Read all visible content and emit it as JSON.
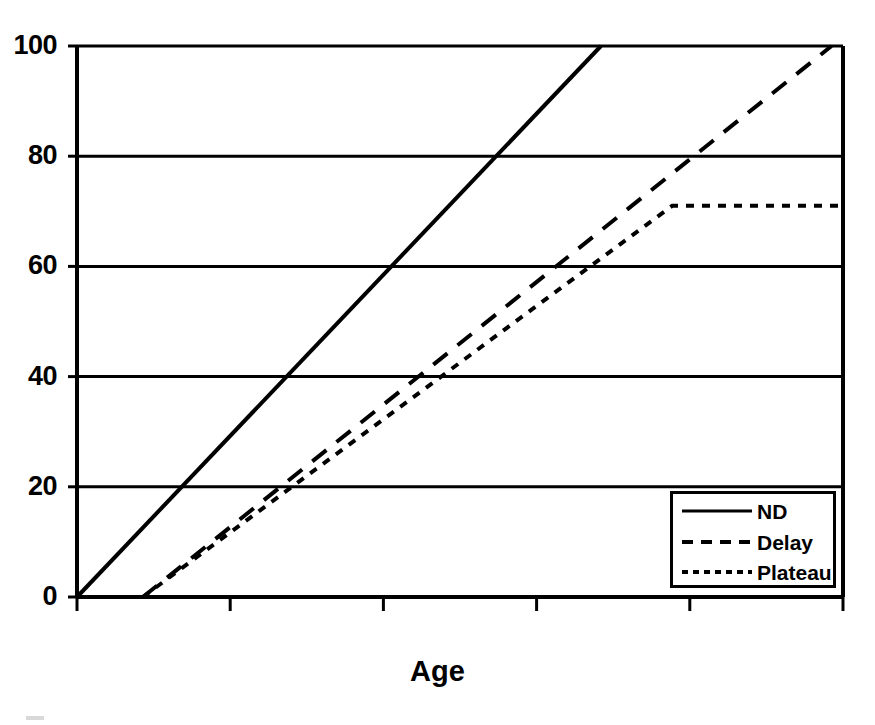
{
  "chart_data": {
    "type": "line",
    "title": "",
    "subtitle": "",
    "xlabel": "Age",
    "ylabel": "",
    "ylim": [
      0,
      100
    ],
    "xlim": [
      0,
      100
    ],
    "yticks": [
      0,
      20,
      40,
      60,
      80,
      100
    ],
    "ytick_labels": [
      "0",
      "20",
      "40",
      "60",
      "80",
      "100"
    ],
    "xticks": [
      0,
      20,
      40,
      60,
      80,
      100
    ],
    "xtick_labels": [
      "",
      "",
      "",
      "",
      "",
      ""
    ],
    "grid": "horizontal",
    "legend_position": "bottom-right",
    "series": [
      {
        "name": "ND",
        "style": "solid",
        "color": "#000000",
        "x": [
          0,
          68.4
        ],
        "y": [
          0,
          100
        ]
      },
      {
        "name": "Delay",
        "style": "dashed",
        "color": "#000000",
        "x": [
          8.6,
          98.5
        ],
        "y": [
          0,
          100
        ]
      },
      {
        "name": "Plateau",
        "style": "dotted",
        "color": "#000000",
        "x": [
          8.6,
          77.7,
          100
        ],
        "y": [
          0,
          71,
          71
        ]
      }
    ]
  },
  "axes": {
    "y_tick_labels": [
      "100",
      "80",
      "60",
      "40",
      "20",
      "0"
    ],
    "x_title": "Age"
  },
  "legend": {
    "entries": [
      {
        "label": "ND",
        "style": "solid"
      },
      {
        "label": "Delay",
        "style": "dashed"
      },
      {
        "label": "Plateau",
        "style": "dotted"
      }
    ]
  },
  "colors": {
    "ink": "#000000",
    "background": "#ffffff"
  }
}
